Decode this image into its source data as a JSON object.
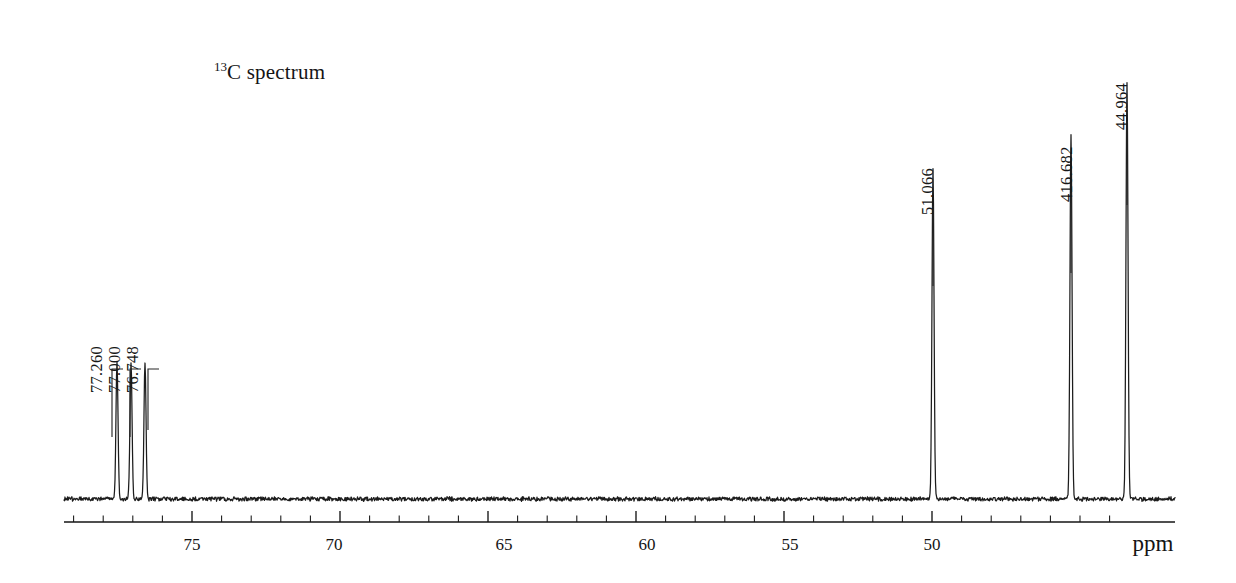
{
  "title": {
    "isotope": "13",
    "text": "C spectrum"
  },
  "axis": {
    "unit_label": "ppm",
    "tick_labels": [
      "75",
      "70",
      "65",
      "60",
      "55",
      "50"
    ],
    "tick_label_positions_px": [
      192,
      334,
      504,
      647,
      790,
      932
    ],
    "unit_label_position_px": 1153
  },
  "peak_labels": [
    {
      "text": "77.260"
    },
    {
      "text": "77.000"
    },
    {
      "text": "76.748"
    },
    {
      "text": "51.066"
    },
    {
      "text": "416.682"
    },
    {
      "text": "44.964"
    }
  ],
  "chart_data": {
    "type": "line",
    "title": "13C spectrum",
    "xlabel": "ppm",
    "ylabel": "",
    "xlim": [
      78.9,
      44.1
    ],
    "axis_direction": "reversed",
    "grid": false,
    "legend": null,
    "x_tick_values": [
      75,
      70,
      65,
      60,
      55,
      50
    ],
    "x_minor_tick_step": 1,
    "annotations": [
      "77.260",
      "77.000",
      "76.748",
      "51.066",
      "416.682",
      "44.964"
    ],
    "peaks": [
      {
        "label": "77.260",
        "ppm": 77.26,
        "relative_height": 0.3,
        "x_px": 117,
        "assignment": "CDCl3"
      },
      {
        "label": "77.000",
        "ppm": 77.0,
        "relative_height": 0.3,
        "x_px": 131,
        "assignment": "CDCl3"
      },
      {
        "label": "76.748",
        "ppm": 76.748,
        "relative_height": 0.3,
        "x_px": 145,
        "assignment": "CDCl3"
      },
      {
        "label": "51.066",
        "ppm": 51.066,
        "relative_height": 0.72,
        "x_px": 933,
        "assignment": ""
      },
      {
        "label": "416.682",
        "ppm": 46.682,
        "relative_height": 0.8,
        "x_px": 1071,
        "assignment": ""
      },
      {
        "label": "44.964",
        "ppm": 44.964,
        "relative_height": 0.91,
        "x_px": 1127,
        "assignment": ""
      }
    ],
    "baseline_y_px": 499,
    "noise_amplitude_px": 2
  }
}
